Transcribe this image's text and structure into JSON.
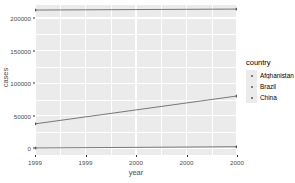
{
  "chart_data": {
    "type": "line",
    "title": "",
    "xlabel": "year",
    "ylabel": "cases",
    "xlim": [
      1999,
      2000
    ],
    "ylim": [
      -10000,
      220000
    ],
    "grid": true,
    "legend_position": "right",
    "legend_title": "country",
    "x": [
      1999,
      2000
    ],
    "x_tick_labels": [
      "1999",
      "1999",
      "2000",
      "2000",
      "2000"
    ],
    "x_tick_values": [
      1999,
      1999.25,
      1999.5,
      1999.75,
      2000
    ],
    "y_tick_labels": [
      "0",
      "50000",
      "100000",
      "150000",
      "200000"
    ],
    "y_tick_values": [
      0,
      50000,
      100000,
      150000,
      200000
    ],
    "series": [
      {
        "name": "Afghanistan",
        "values": [
          745,
          2666
        ],
        "color": "#595959"
      },
      {
        "name": "Brazil",
        "values": [
          37737,
          80488
        ],
        "color": "#595959"
      },
      {
        "name": "China",
        "values": [
          212258,
          213766
        ],
        "color": "#595959"
      }
    ]
  },
  "legend": {
    "title": "country",
    "entries": [
      {
        "label": "Afghanistan"
      },
      {
        "label": "Brazil"
      },
      {
        "label": "China"
      }
    ]
  },
  "axes": {
    "x_title": "year",
    "y_title": "cases"
  },
  "colors": {
    "panel_background": "#ebebeb",
    "grid_line": "#ffffff",
    "axis_text": "#4d4d4d",
    "line_color": "#595959",
    "plot_background": "#ffffff"
  }
}
